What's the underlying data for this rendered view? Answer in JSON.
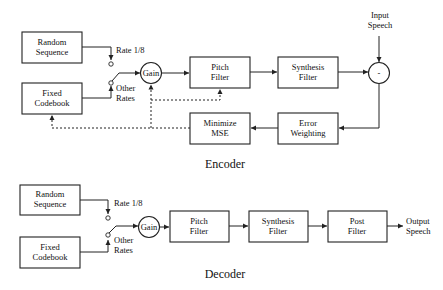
{
  "encoder": {
    "title": "Encoder",
    "random_sequence": [
      "Random",
      "Sequence"
    ],
    "fixed_codebook": [
      "Fixed",
      "Codebook"
    ],
    "rate_low": "Rate 1/8",
    "rate_other": [
      "Other",
      "Rates"
    ],
    "gain": "Gain",
    "pitch_filter": [
      "Pitch",
      "Filter"
    ],
    "synthesis_filter": [
      "Synthesis",
      "Filter"
    ],
    "subtractor": "-",
    "input_speech": [
      "Input",
      "Speech"
    ],
    "minimize_mse": [
      "Minimize",
      "MSE"
    ],
    "error_weighting": [
      "Error",
      "Weighting"
    ]
  },
  "decoder": {
    "title": "Decoder",
    "random_sequence": [
      "Random",
      "Sequence"
    ],
    "fixed_codebook": [
      "Fixed",
      "Codebook"
    ],
    "rate_low": "Rate 1/8",
    "rate_other": [
      "Other",
      "Rates"
    ],
    "gain": "Gain",
    "pitch_filter": [
      "Pitch",
      "Filter"
    ],
    "synthesis_filter": [
      "Synthesis",
      "Filter"
    ],
    "post_filter": [
      "Post",
      "Filter"
    ],
    "output_speech": [
      "Output",
      "Speech"
    ]
  }
}
